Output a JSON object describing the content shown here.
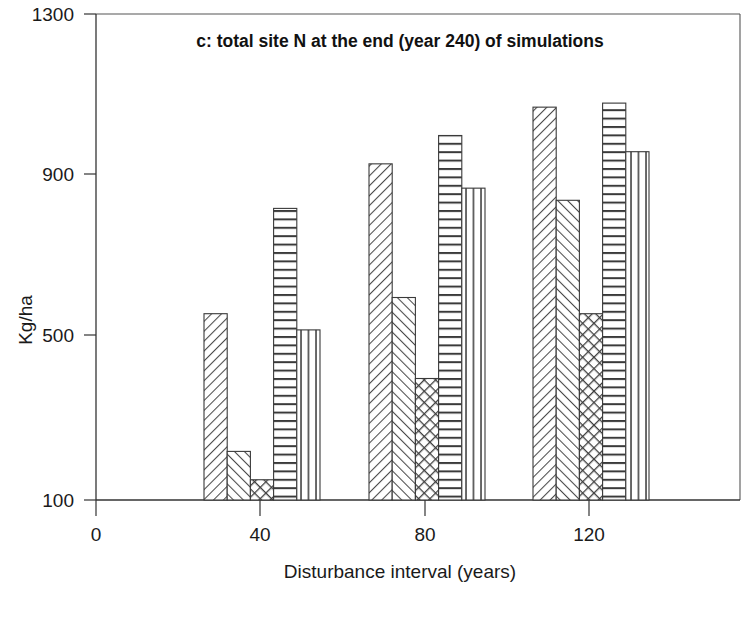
{
  "chart_data": {
    "type": "bar",
    "title": "c: total site N at the end (year 240) of simulations",
    "xlabel": "Disturbance interval (years)",
    "ylabel": "Kg/ha",
    "categories": [
      "40",
      "80",
      "120"
    ],
    "xticklabels": [
      "0",
      "40",
      "80",
      "120"
    ],
    "xtickvalues": [
      0,
      40,
      80,
      120
    ],
    "yticklabels": [
      "100",
      "500",
      "900",
      "1300"
    ],
    "ytickvalues": [
      100,
      500,
      900,
      1300
    ],
    "ylim": [
      100,
      1300
    ],
    "xlim": [
      -10,
      155
    ],
    "grid": false,
    "legend": "none",
    "series": [
      {
        "name": "series-1",
        "pattern": "diagonal-hatch-forward",
        "values": [
          560,
          930,
          1070
        ]
      },
      {
        "name": "series-2",
        "pattern": "diagonal-hatch-back",
        "values": [
          220,
          600,
          840
        ]
      },
      {
        "name": "series-3",
        "pattern": "crosshatch",
        "values": [
          150,
          400,
          560
        ]
      },
      {
        "name": "series-4",
        "pattern": "horizontal-lines",
        "values": [
          820,
          1000,
          1080
        ]
      },
      {
        "name": "series-5",
        "pattern": "vertical-lines",
        "values": [
          520,
          870,
          960
        ]
      }
    ]
  },
  "axes": {
    "y_tick_0": "100",
    "y_tick_1": "500",
    "y_tick_2": "900",
    "y_tick_3": "1300",
    "x_tick_0": "0",
    "x_tick_1": "40",
    "x_tick_2": "80",
    "x_tick_3": "120"
  },
  "colors": {
    "background": "#ffffff",
    "ink": "#1a1a1a",
    "frame": "#555555",
    "bar_stroke": "#3a3a3a"
  }
}
